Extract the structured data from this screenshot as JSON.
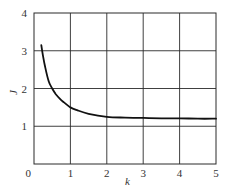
{
  "chart_data": {
    "type": "line",
    "title": "",
    "xlabel": "k",
    "ylabel": "J",
    "xlim": [
      0,
      5
    ],
    "ylim": [
      0,
      4
    ],
    "grid": true,
    "legend": null,
    "x_ticks": [
      "0",
      "1",
      "2",
      "3",
      "4",
      "5"
    ],
    "y_ticks": [
      "1",
      "2",
      "3",
      "4"
    ],
    "series": [
      {
        "name": "J(k)",
        "color": "#111111",
        "x": [
          0.2,
          0.25,
          0.3,
          0.4,
          0.5,
          0.6,
          0.7,
          0.8,
          1.0,
          1.2,
          1.5,
          2.0,
          2.5,
          3.0,
          3.5,
          4.0,
          4.5,
          5.0
        ],
        "y": [
          3.15,
          2.85,
          2.6,
          2.2,
          2.0,
          1.85,
          1.74,
          1.65,
          1.5,
          1.42,
          1.33,
          1.25,
          1.23,
          1.22,
          1.21,
          1.21,
          1.2,
          1.2
        ]
      }
    ]
  },
  "plot": {
    "left": 34,
    "right": 216,
    "top": 13,
    "bottom": 164
  }
}
